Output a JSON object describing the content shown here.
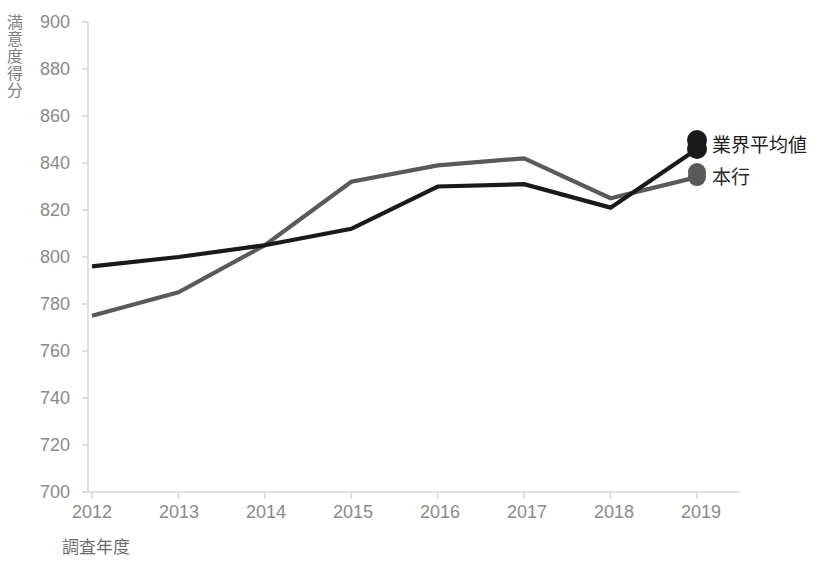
{
  "chart_data": {
    "type": "line",
    "title": "",
    "xlabel": "調査年度",
    "ylabel": "満意度得分",
    "categories": [
      "2012",
      "2013",
      "2014",
      "2015",
      "2016",
      "2017",
      "2018",
      "2019"
    ],
    "ylim": [
      700,
      900
    ],
    "yticks": [
      700,
      720,
      740,
      760,
      780,
      800,
      820,
      840,
      860,
      880,
      900
    ],
    "grid": false,
    "legend_position": "right-inside-end",
    "series": [
      {
        "name": "業界平均値",
        "color": "#1a1a1a",
        "marker_at_end": true,
        "values": [
          796,
          800,
          805,
          812,
          830,
          831,
          821,
          846
        ]
      },
      {
        "name": "本行",
        "color": "#5a5a5a",
        "marker_at_end": true,
        "values": [
          775,
          785,
          805,
          832,
          839,
          842,
          825,
          834
        ]
      }
    ]
  },
  "axis": {
    "y_label_chars": [
      "満",
      "意",
      "度",
      "得",
      "分"
    ],
    "x_label": "調査年度"
  },
  "legend": {
    "items": [
      {
        "label": "業界平均値",
        "color": "#1a1a1a"
      },
      {
        "label": "本行",
        "color": "#5a5a5a"
      }
    ]
  },
  "colors": {
    "series_primary": "#1a1a1a",
    "series_secondary": "#5a5a5a",
    "axis_line": "#d9d9d9",
    "tick_text": "#8a8a8a",
    "background": "#ffffff"
  }
}
